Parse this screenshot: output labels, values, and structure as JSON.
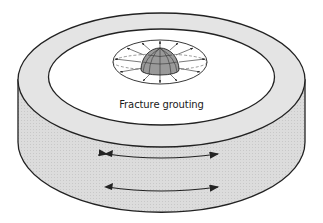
{
  "diagram": {
    "label": "Fracture grouting",
    "colors": {
      "wall_fill": "#d9d9d9",
      "rim_fill": "#e3e3e3",
      "top_fill": "#ffffff",
      "dome_fill": "#9a9a9a",
      "stroke": "#222222"
    },
    "elements": [
      "cylinder-wall",
      "cylinder-rim",
      "inner-top-surface",
      "grout-hemisphere",
      "radial-fracture-arrows",
      "horizontal-double-arrow-upper",
      "horizontal-double-arrow-lower"
    ]
  }
}
